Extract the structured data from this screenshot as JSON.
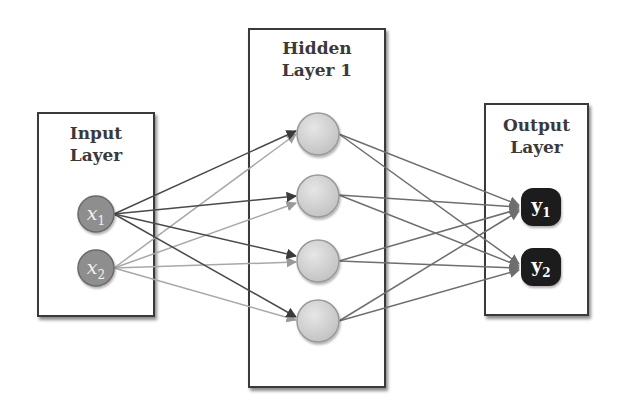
{
  "diagram": {
    "type": "feedforward-neural-network",
    "layers": [
      {
        "id": "input",
        "title_line1": "Input",
        "title_line2": "Layer",
        "nodes": [
          {
            "var": "x",
            "sub": "1"
          },
          {
            "var": "x",
            "sub": "2"
          }
        ]
      },
      {
        "id": "hidden",
        "title_line1": "Hidden",
        "title_line2": "Layer 1",
        "nodes": [
          {},
          {},
          {},
          {}
        ]
      },
      {
        "id": "output",
        "title_line1": "Output",
        "title_line2": "Layer",
        "nodes": [
          {
            "var": "y",
            "sub": "1"
          },
          {
            "var": "y",
            "sub": "2"
          }
        ]
      }
    ],
    "connections": "fully-connected",
    "colors": {
      "box_border": "#3a3a3a",
      "input_node": "#8e8e8e",
      "hidden_node": "#d4d4d4",
      "output_node": "#1e1e1e",
      "edge_from_x1": "#4a4a4a",
      "edge_from_x2": "#a8a8a8",
      "edge_hidden_output": "#6e6e6e"
    }
  }
}
